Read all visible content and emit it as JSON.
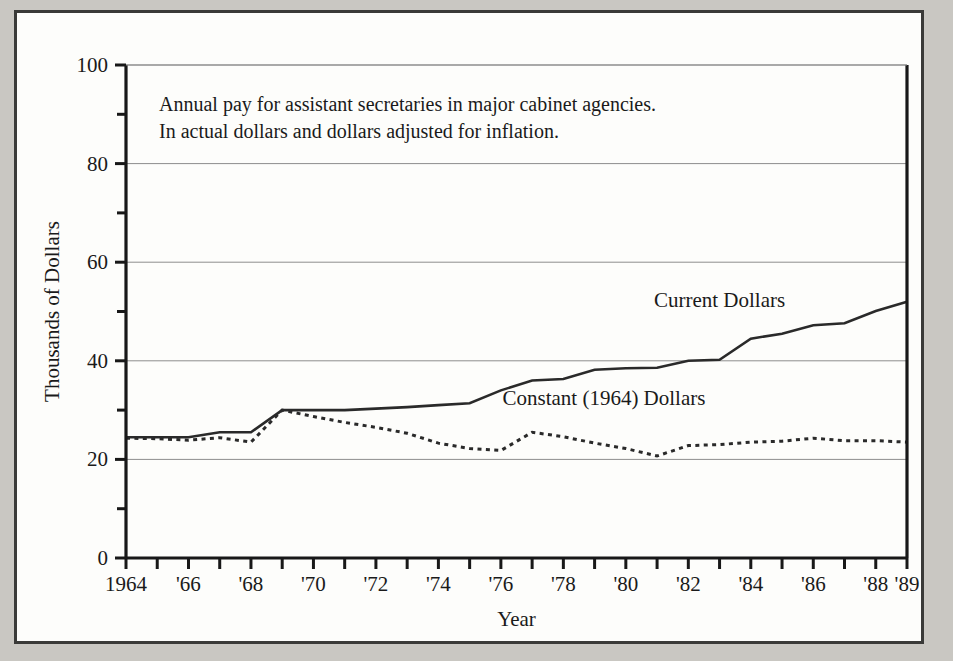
{
  "chart_data": {
    "type": "line",
    "title": "",
    "annotation": [
      "Annual pay for assistant secretaries in major cabinet agencies.",
      "In actual dollars and dollars adjusted for inflation."
    ],
    "xlabel": "Year",
    "ylabel": "Thousands of Dollars",
    "xlim": [
      1964,
      1989
    ],
    "ylim": [
      0,
      100
    ],
    "grid": "horizontal",
    "legend_position": "inline-annotation",
    "y_ticks_major": [
      0,
      20,
      40,
      60,
      80,
      100
    ],
    "y_tick_labels": [
      "0",
      "20",
      "40",
      "60",
      "80",
      "100"
    ],
    "y_ticks_minor": [
      10,
      30,
      50,
      70,
      90
    ],
    "x_ticks": [
      1964,
      1965,
      1966,
      1967,
      1968,
      1969,
      1970,
      1971,
      1972,
      1973,
      1974,
      1975,
      1976,
      1977,
      1978,
      1979,
      1980,
      1981,
      1982,
      1983,
      1984,
      1985,
      1986,
      1987,
      1988,
      1989
    ],
    "x_tick_labels": [
      {
        "year": 1964,
        "label": "1964"
      },
      {
        "year": 1966,
        "label": "'66"
      },
      {
        "year": 1968,
        "label": "'68"
      },
      {
        "year": 1970,
        "label": "'70"
      },
      {
        "year": 1972,
        "label": "'72"
      },
      {
        "year": 1974,
        "label": "'74"
      },
      {
        "year": 1976,
        "label": "'76"
      },
      {
        "year": 1978,
        "label": "'78"
      },
      {
        "year": 1980,
        "label": "'80"
      },
      {
        "year": 1982,
        "label": "'82"
      },
      {
        "year": 1984,
        "label": "'84"
      },
      {
        "year": 1986,
        "label": "'86"
      },
      {
        "year": 1988,
        "label": "'88"
      },
      {
        "year": 1989,
        "label": "'89"
      }
    ],
    "x": [
      1964,
      1965,
      1966,
      1967,
      1968,
      1969,
      1970,
      1971,
      1972,
      1973,
      1974,
      1975,
      1976,
      1977,
      1978,
      1979,
      1980,
      1981,
      1982,
      1983,
      1984,
      1985,
      1986,
      1987,
      1988,
      1989
    ],
    "series": [
      {
        "name": "Current Dollars",
        "style": "solid",
        "values": [
          24.5,
          24.5,
          24.5,
          25.5,
          25.5,
          30.0,
          30.0,
          30.0,
          30.3,
          30.6,
          31.0,
          31.4,
          34.0,
          36.0,
          36.3,
          38.2,
          38.5,
          38.6,
          40.0,
          40.2,
          44.5,
          45.5,
          47.2,
          47.6,
          50.1,
          52.0
        ]
      },
      {
        "name": "Constant (1964) Dollars",
        "style": "dotted",
        "values": [
          24.3,
          24.2,
          23.9,
          24.4,
          23.5,
          30.0,
          28.7,
          27.5,
          26.5,
          25.3,
          23.3,
          22.2,
          21.8,
          25.5,
          24.6,
          23.3,
          22.2,
          20.7,
          22.8,
          23.0,
          23.5,
          23.7,
          24.3,
          23.8,
          23.8,
          23.5
        ]
      }
    ],
    "series_inline_labels": [
      {
        "text": "Current Dollars",
        "x": 1983.0,
        "y": 51.0
      },
      {
        "text": "Constant (1964) Dollars",
        "x": 1979.3,
        "y": 31.0
      }
    ]
  }
}
